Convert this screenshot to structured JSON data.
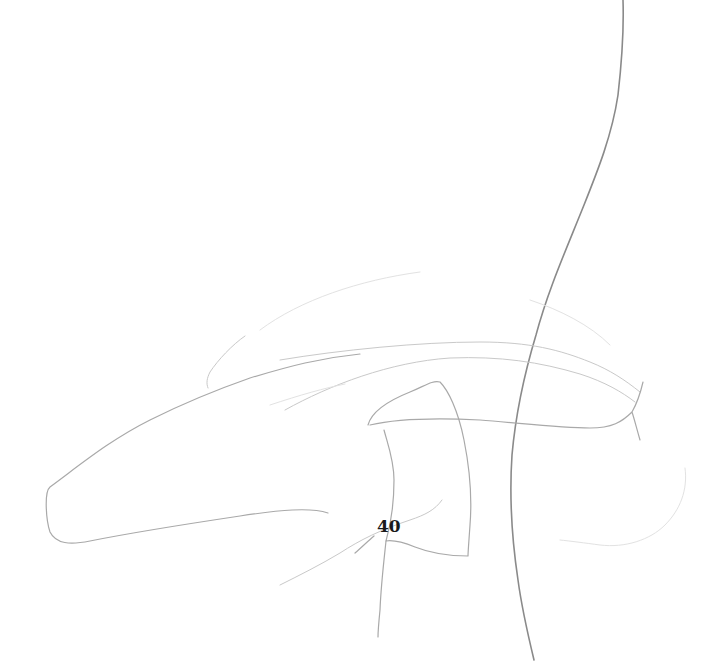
{
  "sketch": {
    "medium": "pencil line drawing",
    "background_color": "#ffffff",
    "stroke_color": "#8a8a8a",
    "label": {
      "text": "40",
      "color": "#1a1a1a"
    },
    "strokes": [
      {
        "name": "long-vertical-curve",
        "tone": "dark"
      },
      {
        "name": "elongated-tapered-outline",
        "tone": "mid"
      },
      {
        "name": "curved-quadrilateral-shape",
        "tone": "mid"
      },
      {
        "name": "horizontal-band-upper",
        "tone": "light"
      },
      {
        "name": "horizontal-band-lower",
        "tone": "light"
      },
      {
        "name": "right-hook-curve",
        "tone": "mid"
      },
      {
        "name": "lower-right-arc",
        "tone": "faint"
      },
      {
        "name": "small-arc-left",
        "tone": "light"
      },
      {
        "name": "diagonal-lower-stroke",
        "tone": "light"
      },
      {
        "name": "short-vertical-stroke",
        "tone": "mid"
      }
    ]
  }
}
